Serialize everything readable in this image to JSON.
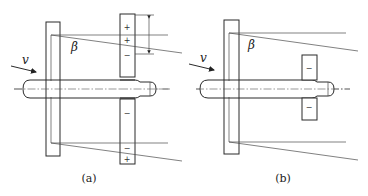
{
  "figure": {
    "panels": [
      {
        "id": "a",
        "caption": "(a)",
        "velocity_label": "v",
        "angle_label": "β",
        "tail_signs": {
          "upper": [
            "+",
            "+",
            "−"
          ],
          "lower": [
            "−",
            "−",
            "+"
          ]
        }
      },
      {
        "id": "b",
        "caption": "(b)",
        "velocity_label": "v",
        "angle_label": "β",
        "tail_signs": {
          "upper": [
            "−"
          ],
          "lower": [
            "−"
          ]
        }
      }
    ]
  }
}
